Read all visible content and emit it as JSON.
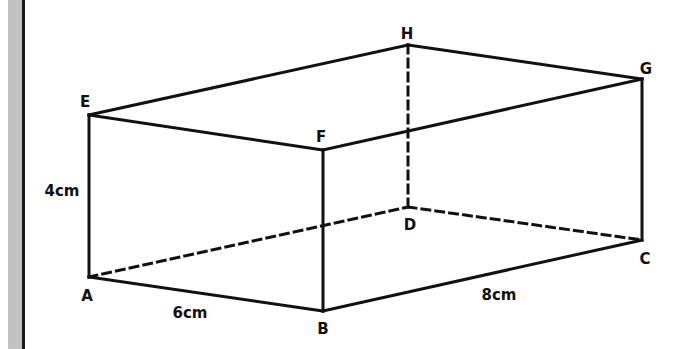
{
  "figure": {
    "type": "cuboid",
    "vertices": {
      "A": {
        "label": "A",
        "x": 89,
        "y": 277,
        "lx": 87,
        "ly": 301
      },
      "B": {
        "label": "B",
        "x": 323,
        "y": 311,
        "lx": 323,
        "ly": 334
      },
      "C": {
        "label": "C",
        "x": 642,
        "y": 240,
        "lx": 645,
        "ly": 264
      },
      "D": {
        "label": "D",
        "x": 408,
        "y": 207,
        "lx": 410,
        "ly": 230
      },
      "E": {
        "label": "E",
        "x": 89,
        "y": 115,
        "lx": 85,
        "ly": 107
      },
      "F": {
        "label": "F",
        "x": 323,
        "y": 150,
        "lx": 321,
        "ly": 142
      },
      "G": {
        "label": "G",
        "x": 642,
        "y": 79,
        "lx": 646,
        "ly": 74
      },
      "H": {
        "label": "H",
        "x": 408,
        "y": 45,
        "lx": 407,
        "ly": 39
      }
    },
    "measurements": {
      "height": "4cm",
      "width": "6cm",
      "length": "8cm"
    },
    "line_color": "#111111",
    "hidden_edges": [
      "AD",
      "DC",
      "DH"
    ],
    "visible_edges": [
      "AB",
      "BC",
      "CG",
      "GH",
      "HE",
      "EA",
      "EF",
      "FG",
      "FB"
    ]
  }
}
